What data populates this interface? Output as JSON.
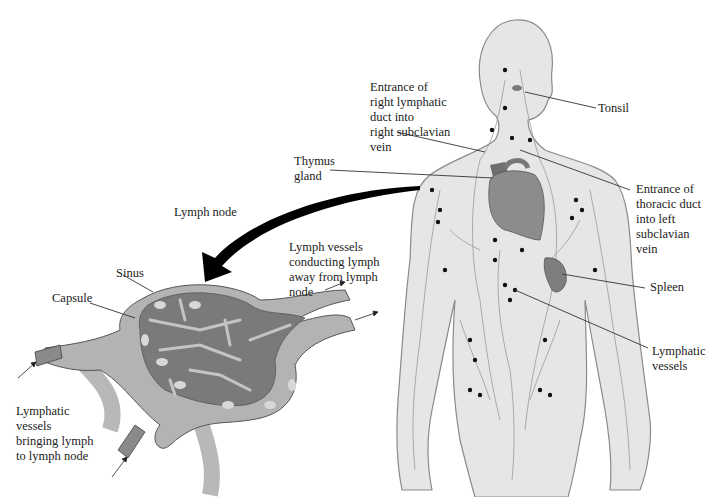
{
  "diagram": {
    "colors": {
      "body_fill": "#e6e6e6",
      "body_outline": "#8a8a8a",
      "vessel": "#9a9a9a",
      "node_dot": "#111111",
      "heart": "#8c8c8c",
      "node_outer": "#b3b3b3",
      "node_inner": "#7a7a7a",
      "node_sinus": "#c4c4c4",
      "arrow": "#000000"
    },
    "labels": {
      "tonsil": "Tonsil",
      "right_lymphatic_duct": "Entrance of\nright lymphatic\nduct into\nright subclavian\nvein",
      "thymus": "Thymus\ngland",
      "thoracic_duct": "Entrance of\nthoracic duct\ninto left\nsubclavian\nvein",
      "lymph_node": "Lymph node",
      "efferent_vessels": "Lymph vessels\nconducting lymph\naway from lymph\nnode",
      "sinus": "Sinus",
      "capsule": "Capsule",
      "spleen": "Spleen",
      "lymphatic_vessels": "Lymphatic\nvessels",
      "afferent_vessels": "Lymphatic\nvessels\nbringing lymph\nto lymph node"
    }
  }
}
